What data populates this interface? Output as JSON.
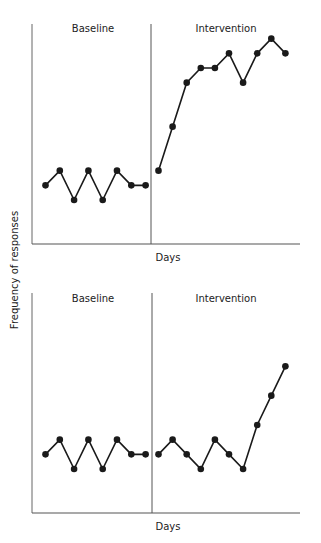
{
  "figure": {
    "y_label": "Frequency of responses"
  },
  "chart_data": [
    {
      "type": "line",
      "title": "",
      "xlabel": "Days",
      "ylabel": "Frequency of responses",
      "ylim": [
        0,
        15
      ],
      "grid": false,
      "legend": null,
      "phases": [
        {
          "label": "Baseline",
          "x": [
            1,
            2,
            3,
            4,
            5,
            6,
            7,
            8
          ],
          "values": [
            4,
            5,
            3,
            5,
            3,
            5,
            4,
            4
          ]
        },
        {
          "label": "Intervention",
          "x": [
            9,
            10,
            11,
            12,
            13,
            14,
            15,
            16,
            17,
            18
          ],
          "values": [
            5,
            8,
            11,
            12,
            12,
            13,
            11,
            13,
            14,
            13
          ]
        }
      ],
      "phase_change_after_day": 8,
      "annotations": [
        "Baseline",
        "Intervention"
      ]
    },
    {
      "type": "line",
      "title": "",
      "xlabel": "Days",
      "ylabel": "Frequency of responses",
      "ylim": [
        0,
        15
      ],
      "grid": false,
      "legend": null,
      "phases": [
        {
          "label": "Baseline",
          "x": [
            1,
            2,
            3,
            4,
            5,
            6,
            7,
            8
          ],
          "values": [
            4,
            5,
            3,
            5,
            3,
            5,
            4,
            4
          ]
        },
        {
          "label": "Intervention",
          "x": [
            9,
            10,
            11,
            12,
            13,
            14,
            15,
            16,
            17,
            18
          ],
          "values": [
            4,
            5,
            4,
            3,
            5,
            4,
            3,
            6,
            8,
            10
          ]
        }
      ],
      "phase_change_after_day": 8,
      "annotations": [
        "Baseline",
        "Intervention"
      ]
    }
  ],
  "panels": [
    {
      "baseline_label": "Baseline",
      "intervention_label": "Intervention",
      "x_label": "Days"
    },
    {
      "baseline_label": "Baseline",
      "intervention_label": "Intervention",
      "x_label": "Days"
    }
  ],
  "colors": {
    "line": "#1a1a1a",
    "axis": "#555555",
    "text": "#222222"
  }
}
